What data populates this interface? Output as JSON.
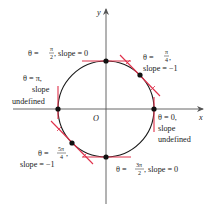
{
  "figure": {
    "type": "polar circle tangent diagram",
    "axes": {
      "x_label": "x",
      "y_label": "y",
      "origin_label": "O"
    },
    "curve": {
      "shape": "circle",
      "center": [
        106,
        109
      ],
      "radius": 48,
      "stroke": "#1a1a1a"
    },
    "colors": {
      "tangent": "#e0304a",
      "point": "#111111",
      "axis": "#555555",
      "text": "#222222"
    },
    "points": [
      {
        "id": "theta-pi-over-2",
        "theta_prefix": "θ = ",
        "theta_num": "π",
        "theta_den": "2",
        "rest": ", slope = 0",
        "slope": "0"
      },
      {
        "id": "theta-pi-over-4",
        "theta_prefix": "θ = ",
        "theta_num": "π",
        "theta_den": "4",
        "comma": ",",
        "slope_line": "slope = −1",
        "slope": "−1"
      },
      {
        "id": "theta-pi",
        "line1": "θ = π,",
        "line2": "slope",
        "line3": "undefined",
        "slope": "undefined"
      },
      {
        "id": "theta-0",
        "line1": "θ = 0,",
        "line2": "slope",
        "line3": "undefined",
        "slope": "undefined"
      },
      {
        "id": "theta-5pi-over-4",
        "theta_prefix": "θ = ",
        "theta_num": "5π",
        "theta_den": "4",
        "comma": ",",
        "slope_line": "slope = −1",
        "slope": "−1"
      },
      {
        "id": "theta-3pi-over-2",
        "theta_prefix": "θ = ",
        "theta_num": "3π",
        "theta_den": "2",
        "rest": ", slope = 0",
        "slope": "0"
      }
    ]
  }
}
